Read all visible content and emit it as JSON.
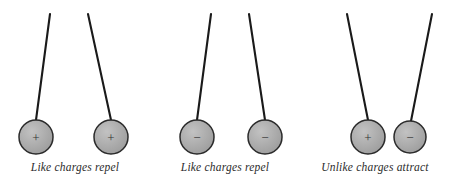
{
  "figure": {
    "background_color": "#ffffff",
    "sphere_fill": "#a8a8a8",
    "sphere_stroke": "#2b2b2b",
    "thread_color": "#1a1a1a",
    "sign_color": "#333333",
    "caption_color": "#2b2b2b"
  },
  "groups": [
    {
      "id": "group-like-positive",
      "caption": "Like charges repel",
      "interaction": "repel",
      "pivot_y": 14,
      "left": {
        "charge_sign": "+",
        "charge_label": "positive",
        "anchor_x": 50,
        "sphere_cx": 36,
        "sphere_cy": 137,
        "sphere_r": 17
      },
      "right": {
        "charge_sign": "+",
        "charge_label": "positive",
        "anchor_x": 88,
        "sphere_cx": 111,
        "sphere_cy": 137,
        "sphere_r": 17
      }
    },
    {
      "id": "group-like-negative",
      "caption": "Like charges repel",
      "interaction": "repel",
      "pivot_y": 14,
      "left": {
        "charge_sign": "−",
        "charge_label": "negative",
        "anchor_x": 211,
        "sphere_cx": 197,
        "sphere_cy": 137,
        "sphere_r": 17
      },
      "right": {
        "charge_sign": "−",
        "charge_label": "negative",
        "anchor_x": 249,
        "sphere_cx": 265,
        "sphere_cy": 137,
        "sphere_r": 17
      }
    },
    {
      "id": "group-unlike",
      "caption": "Unlike charges attract",
      "interaction": "attract",
      "pivot_y": 14,
      "left": {
        "charge_sign": "+",
        "charge_label": "positive",
        "anchor_x": 347,
        "sphere_cx": 368,
        "sphere_cy": 137,
        "sphere_r": 17
      },
      "right": {
        "charge_sign": "−",
        "charge_label": "negative",
        "anchor_x": 432,
        "sphere_cx": 410,
        "sphere_cy": 137,
        "sphere_r": 16
      }
    }
  ]
}
